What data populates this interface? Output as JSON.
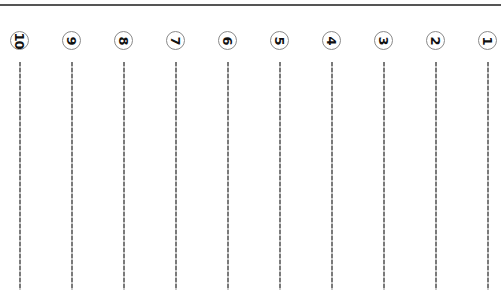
{
  "sheet": {
    "top_rule_color": "#555555",
    "line_color": "#7a7a7a",
    "badge_border_color": "#8a8a8a",
    "number_rotation": "90deg-clockwise"
  },
  "columns": [
    {
      "number": "10",
      "x": 20
    },
    {
      "number": "9",
      "x": 72
    },
    {
      "number": "8",
      "x": 124
    },
    {
      "number": "7",
      "x": 176
    },
    {
      "number": "6",
      "x": 228
    },
    {
      "number": "5",
      "x": 280
    },
    {
      "number": "4",
      "x": 332
    },
    {
      "number": "3",
      "x": 384
    },
    {
      "number": "2",
      "x": 436
    },
    {
      "number": "1",
      "x": 488
    }
  ]
}
